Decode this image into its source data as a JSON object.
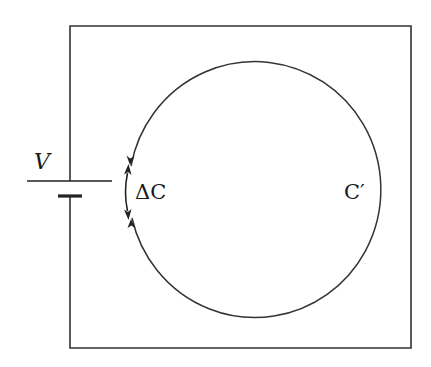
{
  "diagram": {
    "type": "circuit",
    "labels": {
      "voltage": "V",
      "delta_c": "ΔC",
      "c_prime": "C′"
    },
    "colors": {
      "stroke": "#333333",
      "background": "#ffffff"
    },
    "elements": [
      {
        "id": "battery",
        "kind": "voltage-source",
        "label": "V"
      },
      {
        "id": "loop",
        "kind": "closed-curve",
        "label": "C′"
      },
      {
        "id": "gap",
        "kind": "curve-segment",
        "label": "ΔC"
      }
    ]
  }
}
